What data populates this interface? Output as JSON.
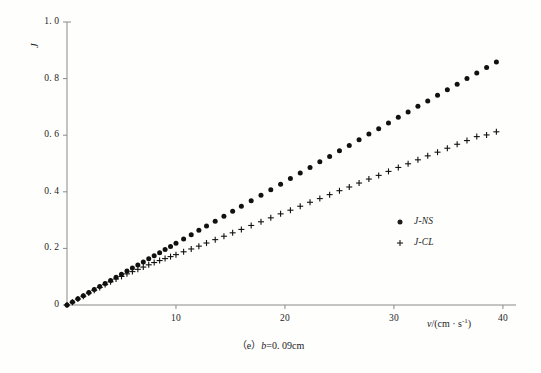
{
  "figure": {
    "caption_prefix": "（e）",
    "caption_expr": "b",
    "caption_value": "=0. 09cm",
    "background_color": "#fefefd",
    "ink_color": "#1c1c1c",
    "axis_color": "#8a8a8a"
  },
  "axes": {
    "y_title": "J",
    "x_title_var": "v",
    "x_title_unit": "/(cm · s",
    "x_title_sup": "-1",
    "x_title_close": ")",
    "y_ticks": [
      {
        "value": 0,
        "label": "0"
      },
      {
        "value": 0.2,
        "label": "0. 2"
      },
      {
        "value": 0.4,
        "label": "0. 4"
      },
      {
        "value": 0.6,
        "label": "0. 6"
      },
      {
        "value": 0.8,
        "label": "0. 8"
      },
      {
        "value": 1.0,
        "label": "1. 0"
      }
    ],
    "x_ticks": [
      {
        "value": 10,
        "label": "10"
      },
      {
        "value": 20,
        "label": "20"
      },
      {
        "value": 30,
        "label": "30"
      },
      {
        "value": 40,
        "label": "40"
      }
    ]
  },
  "legend": {
    "entries": [
      {
        "marker": "dot",
        "label": "J-NS"
      },
      {
        "marker": "plus",
        "label": "J-CL"
      }
    ]
  },
  "chart_data": {
    "type": "scatter",
    "title": "（e）b=0. 09cm",
    "xlabel": "v/(cm · s^-1)",
    "ylabel": "J",
    "xlim": [
      0,
      41.2
    ],
    "ylim": [
      0,
      1.0
    ],
    "grid": false,
    "legend_position": "center-right",
    "series": [
      {
        "name": "J-NS",
        "marker": "filled-circle",
        "color": "#111111",
        "x": [
          0.0,
          0.5,
          1.0,
          1.5,
          2.0,
          2.5,
          3.0,
          3.5,
          4.0,
          4.5,
          5.0,
          5.5,
          6.0,
          6.5,
          7.0,
          7.5,
          8.0,
          8.5,
          9.0,
          9.5,
          10.0,
          10.7,
          11.4,
          12.1,
          12.8,
          13.6,
          14.4,
          15.2,
          16.0,
          16.9,
          17.8,
          18.7,
          19.6,
          20.5,
          21.4,
          22.3,
          23.2,
          24.1,
          25.0,
          25.9,
          26.8,
          27.7,
          28.6,
          29.5,
          30.4,
          31.3,
          32.2,
          33.1,
          34.0,
          34.9,
          35.8,
          36.7,
          37.6,
          38.5,
          39.4
        ],
        "y": [
          0.0,
          0.011,
          0.022,
          0.033,
          0.044,
          0.055,
          0.065,
          0.076,
          0.087,
          0.098,
          0.109,
          0.12,
          0.131,
          0.141,
          0.152,
          0.163,
          0.174,
          0.185,
          0.196,
          0.207,
          0.218,
          0.233,
          0.248,
          0.264,
          0.279,
          0.296,
          0.314,
          0.331,
          0.349,
          0.368,
          0.388,
          0.407,
          0.427,
          0.447,
          0.466,
          0.486,
          0.506,
          0.525,
          0.545,
          0.564,
          0.584,
          0.604,
          0.623,
          0.643,
          0.663,
          0.682,
          0.702,
          0.721,
          0.741,
          0.761,
          0.78,
          0.8,
          0.82,
          0.839,
          0.859
        ]
      },
      {
        "name": "J-CL",
        "marker": "plus",
        "color": "#111111",
        "x": [
          0.0,
          0.5,
          1.0,
          1.5,
          2.0,
          2.5,
          3.0,
          3.5,
          4.0,
          4.5,
          5.0,
          5.5,
          6.0,
          6.5,
          7.0,
          7.5,
          8.0,
          8.5,
          9.0,
          9.5,
          10.0,
          10.7,
          11.4,
          12.1,
          12.8,
          13.6,
          14.4,
          15.2,
          16.0,
          16.9,
          17.8,
          18.7,
          19.6,
          20.5,
          21.4,
          22.3,
          23.2,
          24.1,
          25.0,
          25.9,
          26.8,
          27.7,
          28.6,
          29.5,
          30.4,
          31.3,
          32.2,
          33.1,
          34.0,
          34.9,
          35.8,
          36.7,
          37.6,
          38.5,
          39.4
        ],
        "y": [
          0.0,
          0.01,
          0.021,
          0.031,
          0.042,
          0.052,
          0.062,
          0.072,
          0.082,
          0.092,
          0.101,
          0.11,
          0.118,
          0.126,
          0.134,
          0.142,
          0.15,
          0.157,
          0.164,
          0.171,
          0.178,
          0.188,
          0.198,
          0.208,
          0.219,
          0.231,
          0.243,
          0.255,
          0.267,
          0.281,
          0.294,
          0.308,
          0.322,
          0.335,
          0.349,
          0.363,
          0.376,
          0.39,
          0.404,
          0.417,
          0.431,
          0.445,
          0.458,
          0.472,
          0.486,
          0.499,
          0.513,
          0.527,
          0.54,
          0.554,
          0.568,
          0.581,
          0.595,
          0.601,
          0.612
        ]
      }
    ]
  },
  "geometry": {
    "origin_x": 67,
    "origin_y": 305,
    "x_max_px": 516,
    "y_top_px": 22,
    "x_data_max": 41.2,
    "y_data_max": 1.0
  }
}
